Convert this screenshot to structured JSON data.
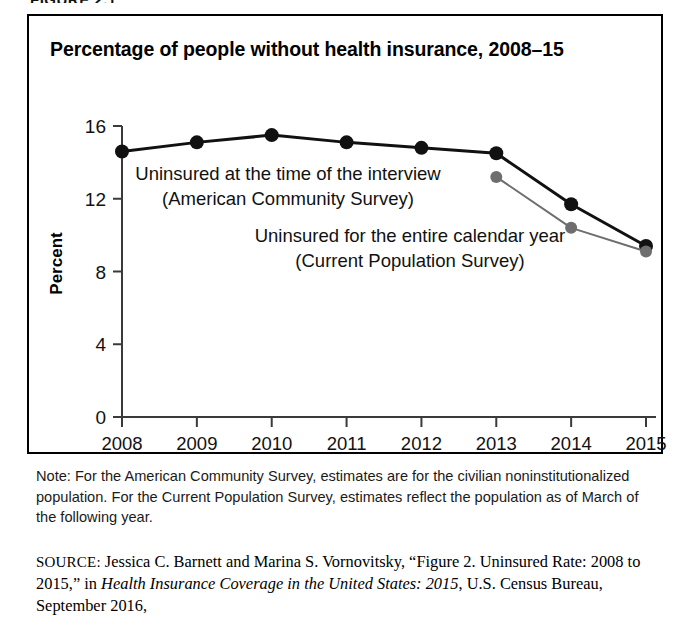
{
  "figure_header": "FIGURE 2.1",
  "chart_title": "Percentage of people without health insurance, 2008–15",
  "annotations": {
    "acs_line1": "Uninsured at the time of the interview",
    "acs_line2": "(American Community Survey)",
    "cps_line1": "Uninsured for the entire calendar year",
    "cps_line2": "(Current Population Survey)"
  },
  "note": {
    "label": "Note:",
    "text": "Note: For the American Community Survey, estimates are for the civilian noninstitutionalized population. For the Current Population Survey, estimates reflect the population as of March of the following year."
  },
  "source": {
    "label": "SOURCE:",
    "part1": " Jessica C. Barnett and Marina S. Vornovitsky, “Figure 2. Uninsured Rate: 2008 to 2015,” in ",
    "italic1": "Health Insurance Coverage in the United States: 2015",
    "part2": ", U.S. Census Bureau, September 2016,"
  },
  "colors": {
    "acs": "#111111",
    "cps": "#6e6e6e",
    "axis": "#3a3a3a",
    "frame": "#000000",
    "background": "#ffffff"
  },
  "chart_data": {
    "type": "line",
    "title": "Percentage of people without health insurance, 2008–15",
    "xlabel": "",
    "ylabel": "Percent",
    "categories": [
      "2008",
      "2009",
      "2010",
      "2011",
      "2012",
      "2013",
      "2014",
      "2015"
    ],
    "x": [
      2008,
      2009,
      2010,
      2011,
      2012,
      2013,
      2014,
      2015
    ],
    "ylim": [
      0,
      16
    ],
    "yticks": [
      0,
      4,
      8,
      12,
      16
    ],
    "ytick_labels": [
      "0",
      "4",
      "8",
      "12",
      "16"
    ],
    "grid": false,
    "legend_position": "inline-annotations",
    "series": [
      {
        "name": "Uninsured at the time of the interview (American Community Survey)",
        "short_name": "American Community Survey",
        "color": "#111111",
        "x": [
          2008,
          2009,
          2010,
          2011,
          2012,
          2013,
          2014,
          2015
        ],
        "values": [
          14.6,
          15.1,
          15.5,
          15.1,
          14.8,
          14.5,
          11.7,
          9.4
        ]
      },
      {
        "name": "Uninsured for the entire calendar year (Current Population Survey)",
        "short_name": "Current Population Survey",
        "color": "#6e6e6e",
        "x": [
          2013,
          2014,
          2015
        ],
        "values": [
          13.2,
          10.4,
          9.1
        ]
      }
    ]
  }
}
